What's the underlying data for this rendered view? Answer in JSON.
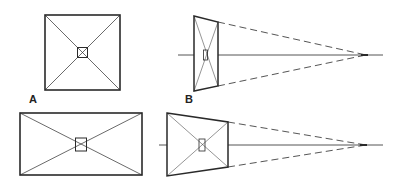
{
  "figure": {
    "labels": {
      "a": "A",
      "b": "B"
    },
    "panels": [
      {
        "id": "A-top",
        "description": "Square frontal view with diagonals and central small square"
      },
      {
        "id": "B-top",
        "description": "Square in perspective converging to vanishing point on axis"
      },
      {
        "id": "A-bottom",
        "description": "Rectangle frontal view with diagonals and central small square"
      },
      {
        "id": "B-bottom",
        "description": "Rectangle in perspective converging to vanishing point on axis"
      }
    ],
    "colors": {
      "line": "#2a2a2a",
      "background": "#ffffff"
    }
  }
}
